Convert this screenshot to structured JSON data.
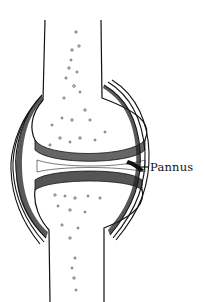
{
  "diagram": {
    "labels": [
      {
        "text": "Pannus",
        "target": "pannus-tissue"
      }
    ],
    "colors": {
      "ink": "#111111",
      "background": "#ffffff",
      "cartilage_shade": "#555555"
    }
  }
}
